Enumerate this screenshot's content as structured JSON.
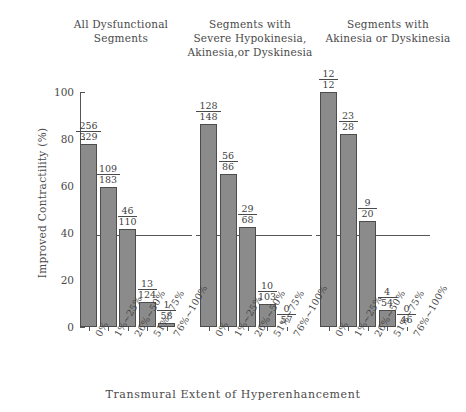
{
  "chart_data": {
    "type": "bar",
    "title": "",
    "xlabel": "Transmural Extent of Hyperenhancement",
    "ylabel": "Improved Contractility (%)",
    "ylim": [
      0,
      100
    ],
    "yticks": [
      0,
      20,
      40,
      60,
      80,
      100
    ],
    "ytick_labels": [
      "0",
      "20",
      "40",
      "60",
      "80",
      "100"
    ],
    "grid": false,
    "legend": "none",
    "categories": [
      "0%",
      "1%~25%",
      "26%~50%",
      "51%~75%",
      "76%~100%"
    ],
    "bar_color": "#8b8b8b",
    "bar_edge_color": "#4d4d4d",
    "panels": [
      {
        "title": "All Dysfunctional\nSegments",
        "values": [
          77.8,
          59.6,
          41.8,
          10.5,
          1.7
        ],
        "labels": [
          {
            "numerator": "256",
            "denominator": "329"
          },
          {
            "numerator": "109",
            "denominator": "183"
          },
          {
            "numerator": "46",
            "denominator": "110"
          },
          {
            "numerator": "13",
            "denominator": "124"
          },
          {
            "numerator": "1",
            "denominator": "58"
          }
        ]
      },
      {
        "title": "Segments with\nSevere Hypokinesia,\nAkinesia,or Dyskinesia",
        "values": [
          86.5,
          65.1,
          42.6,
          9.7,
          0.0
        ],
        "labels": [
          {
            "numerator": "128",
            "denominator": "148"
          },
          {
            "numerator": "56",
            "denominator": "86"
          },
          {
            "numerator": "29",
            "denominator": "68"
          },
          {
            "numerator": "10",
            "denominator": "103"
          },
          {
            "numerator": "0",
            "denominator": "57"
          }
        ]
      },
      {
        "title": "Segments with\nAkinesia or Dyskinesia",
        "values": [
          100.0,
          82.1,
          45.0,
          7.4,
          0.0
        ],
        "labels": [
          {
            "numerator": "12",
            "denominator": "12"
          },
          {
            "numerator": "23",
            "denominator": "28"
          },
          {
            "numerator": "9",
            "denominator": "20"
          },
          {
            "numerator": "4",
            "denominator": "54"
          },
          {
            "numerator": "0",
            "denominator": "46"
          }
        ]
      }
    ]
  }
}
